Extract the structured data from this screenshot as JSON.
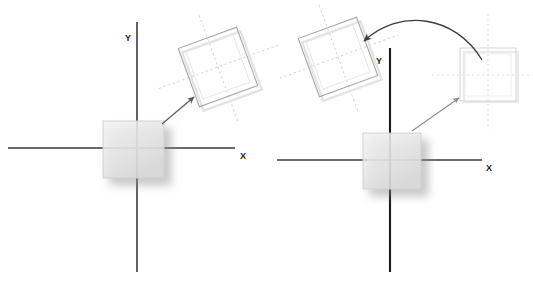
{
  "figure": {
    "title": "",
    "width": 533,
    "height": 282,
    "background": "#ffffff",
    "panels": [
      {
        "id": "left-panel",
        "name": "rotation-about-corner-diagram",
        "origin": {
          "x": 137,
          "y": 148
        },
        "axes": {
          "x": {
            "label": "X",
            "label_x": 243,
            "label_y": 159,
            "x1": 8,
            "x2": 235,
            "y": 148,
            "color": "#3a3a3a"
          },
          "y": {
            "label": "Y",
            "label_x": 128,
            "label_y": 41,
            "y1": 22,
            "y2": 272,
            "x": 137,
            "color": "#3a3a3a"
          }
        },
        "source_square": {
          "name": "original-square",
          "x": 103,
          "y": 121,
          "w": 61,
          "h": 57,
          "fill": "#e8e8e8",
          "stroke": "#cccccc",
          "shadow": "#b9b9b9"
        },
        "result_square": {
          "name": "rotated-square",
          "cx": 218,
          "cy": 67,
          "size": 62,
          "rotation_deg": -20,
          "fill": "none",
          "stroke": "#a9a9a9",
          "ghost_stroke": "#e0e0e0",
          "guide_color": "#cfcfcf"
        },
        "arrow": {
          "name": "transform-arrow",
          "from_x": 162,
          "from_y": 124,
          "to_x": 196,
          "to_y": 95,
          "color": "#6a6a6a",
          "style": "straight"
        }
      },
      {
        "id": "right-panel",
        "name": "translate-then-rotate-diagram",
        "origin": {
          "x": 390,
          "y": 148
        },
        "axes": {
          "x": {
            "label": "X",
            "label_x": 489,
            "label_y": 171,
            "x1": 277,
            "x2": 482,
            "y": 160,
            "color": "#3a3a3a"
          },
          "y": {
            "label": "Y",
            "label_x": 379,
            "label_y": 64,
            "y1": 48,
            "y2": 272,
            "x": 390,
            "color": "#1a1a1a"
          }
        },
        "source_square": {
          "name": "original-square",
          "x": 363,
          "y": 133,
          "w": 58,
          "h": 56,
          "fill": "#e8e8e8",
          "stroke": "#cccccc",
          "shadow": "#b9b9b9"
        },
        "intermediate_square": {
          "name": "translated-square",
          "x": 460,
          "y": 48,
          "w": 56,
          "h": 53,
          "fill": "none",
          "stroke": "#d8d8d8",
          "guide_color": "#e2e2e2"
        },
        "result_square": {
          "name": "rotated-square",
          "cx": 338,
          "cy": 57,
          "size": 62,
          "rotation_deg": -20,
          "fill": "none",
          "stroke": "#a9a9a9",
          "ghost_stroke": "#e0e0e0",
          "guide_color": "#cfcfcf"
        },
        "arrow_translate": {
          "name": "translate-arrow",
          "from_x": 412,
          "from_y": 131,
          "to_x": 461,
          "to_y": 96,
          "color": "#8c8c8c",
          "style": "straight"
        },
        "arrow_rotate": {
          "name": "rotate-arrow",
          "from_x": 482,
          "from_y": 60,
          "ctrl_x": 420,
          "ctrl_y": 12,
          "to_x": 362,
          "to_y": 42,
          "color": "#4a4a4a",
          "style": "curved"
        }
      }
    ]
  }
}
